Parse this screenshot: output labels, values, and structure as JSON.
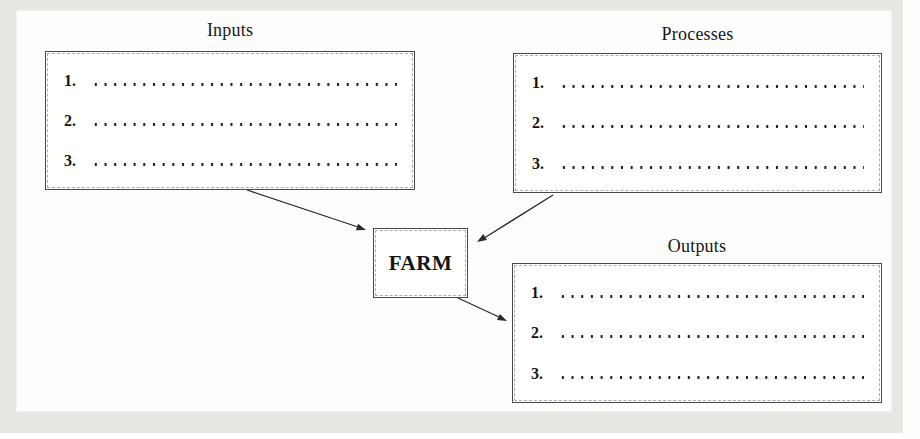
{
  "colors": {
    "ink": "#2b2b2b",
    "box_border": "#4a4a4a",
    "paper": "#fdfdfc",
    "frame_band": "#e8e7e4"
  },
  "farm": {
    "label": "FARM"
  },
  "boxes": {
    "inputs": {
      "title": "Inputs",
      "items": [
        {
          "number": "1."
        },
        {
          "number": "2."
        },
        {
          "number": "3."
        }
      ]
    },
    "processes": {
      "title": "Processes",
      "items": [
        {
          "number": "1."
        },
        {
          "number": "2."
        },
        {
          "number": "3."
        }
      ]
    },
    "outputs": {
      "title": "Outputs",
      "items": [
        {
          "number": "1."
        },
        {
          "number": "2."
        },
        {
          "number": "3."
        }
      ]
    }
  },
  "arrows": [
    {
      "from": "Inputs",
      "to": "FARM"
    },
    {
      "from": "Processes",
      "to": "FARM"
    },
    {
      "from": "FARM",
      "to": "Outputs"
    }
  ]
}
